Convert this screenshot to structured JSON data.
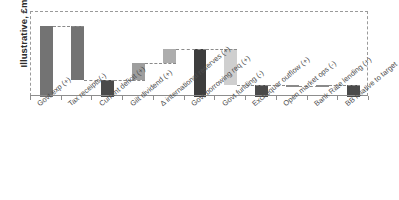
{
  "chart_data": {
    "type": "bar",
    "subtype": "waterfall",
    "title": "",
    "xlabel": "",
    "ylabel": "Illustrative, £m",
    "ylim": [
      0,
      100
    ],
    "grid": false,
    "legend": "none",
    "axis_tick_labels_y": [],
    "categories": [
      "Govt exp (+)",
      "Tax receipts(-)",
      "Current deficit (+)",
      "Gilt dividend (+)",
      "Δ international reserves (+)",
      "Govt borrowing req (+)",
      "Govt funding (-)",
      "Exchequer outflow (+)",
      "Open market ops (-)",
      "Bank Rate lending (+)",
      "BB relative to target"
    ],
    "bars": [
      {
        "label": "Govt exp (+)",
        "start": 0,
        "end": 84,
        "value": 84,
        "kind": "increase",
        "color": "#737373"
      },
      {
        "label": "Tax receipts(-)",
        "start": 84,
        "end": 20,
        "value": -64,
        "kind": "decrease",
        "color": "#737373"
      },
      {
        "label": "Current deficit (+)",
        "start": 0,
        "end": 20,
        "value": 20,
        "kind": "subtotal",
        "color": "#4a4a4a"
      },
      {
        "label": "Gilt dividend (+)",
        "start": 20,
        "end": 40,
        "value": 20,
        "kind": "increase",
        "color": "#9e9e9e"
      },
      {
        "label": "Δ international reserves (+)",
        "start": 40,
        "end": 56,
        "value": 16,
        "kind": "increase",
        "color": "#adadad"
      },
      {
        "label": "Govt borrowing req (+)",
        "start": 0,
        "end": 57,
        "value": 57,
        "kind": "subtotal",
        "color": "#3d3d3d"
      },
      {
        "label": "Govt funding (-)",
        "start": 57,
        "end": 14,
        "value": -43,
        "kind": "decrease",
        "color": "#cfcfcf"
      },
      {
        "label": "Exchequer outflow (+)",
        "start": 0,
        "end": 14,
        "value": 14,
        "kind": "subtotal",
        "color": "#4a4a4a"
      },
      {
        "label": "Open market ops (-)",
        "start": 14,
        "end": 13,
        "value": -1,
        "kind": "decrease",
        "color": "#8a8a8a"
      },
      {
        "label": "Bank Rate lending (+)",
        "start": 13,
        "end": 14,
        "value": 1,
        "kind": "increase",
        "color": "#8a8a8a"
      },
      {
        "label": "BB relative to target",
        "start": 0,
        "end": 14,
        "value": 14,
        "kind": "subtotal",
        "color": "#4a4a4a"
      }
    ],
    "colors": {
      "dark_gray": "#4a4a4a",
      "darkest_gray": "#3d3d3d",
      "medium_gray": "#737373",
      "light_gray": "#cfcfcf",
      "connector": "#8a8a8a",
      "frame": "#9a9a9a"
    }
  },
  "axis": {
    "y_title": "Illustrative, £m"
  }
}
